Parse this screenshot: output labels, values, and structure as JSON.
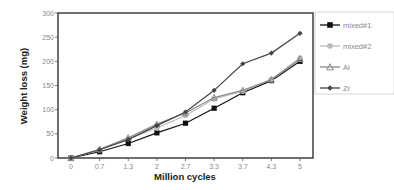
{
  "chart_data": {
    "type": "line",
    "title": "",
    "xlabel": "Million cycles",
    "ylabel": "Weight loss (mg)",
    "categories": [
      "0",
      "0.7",
      "1.3",
      "2",
      "2.7",
      "3.3",
      "3.7",
      "4.3",
      "5"
    ],
    "ylim": [
      0,
      300
    ],
    "yticks": [
      0,
      50,
      100,
      150,
      200,
      250,
      300
    ],
    "grid": false,
    "legend_position": "right",
    "series": [
      {
        "name": "mixed#1",
        "color": "#111111",
        "marker": "square",
        "values": [
          0,
          13,
          30,
          52,
          72,
          103,
          135,
          160,
          200
        ]
      },
      {
        "name": "mixed#2",
        "color": "#bbbbbb",
        "marker": "circle",
        "values": [
          0,
          17,
          40,
          62,
          88,
          122,
          138,
          163,
          207
        ]
      },
      {
        "name": "Al",
        "color": "#888888",
        "marker": "triangle",
        "values": [
          0,
          18,
          42,
          70,
          93,
          125,
          140,
          162,
          205
        ]
      },
      {
        "name": "Zr",
        "color": "#444444",
        "marker": "diamond",
        "values": [
          0,
          17,
          38,
          67,
          95,
          140,
          195,
          217,
          258
        ]
      }
    ]
  }
}
